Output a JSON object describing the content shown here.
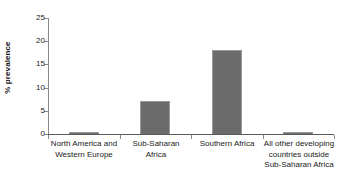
{
  "chart_data": {
    "type": "bar",
    "title": "",
    "subtitle": "",
    "xlabel": "",
    "ylabel": "% prevalence",
    "ylim": [
      0,
      25
    ],
    "yticks": [
      0,
      5,
      10,
      15,
      20,
      25
    ],
    "ytick_labels": [
      "0",
      "5",
      "10",
      "15",
      "20",
      "25"
    ],
    "grid": false,
    "legend": false,
    "legend_position": "none",
    "bar_color": "#6b6b6b",
    "bar_border_color": "#9a9a9a",
    "axis_color": "#8a8a8a",
    "categories": [
      "North America and Western Europe",
      "Sub-Saharan Africa",
      "Southern Africa",
      "All other developing countries outside Sub-Saharan Africa"
    ],
    "category_label_lines": [
      [
        "North America and",
        "Western Europe"
      ],
      [
        "Sub-Saharan",
        "Africa"
      ],
      [
        "Southern Africa"
      ],
      [
        "All other developing",
        "countries outside",
        "Sub-Saharan Africa"
      ]
    ],
    "values": [
      0.4,
      7.2,
      18.0,
      0.4
    ],
    "series": [
      {
        "name": "% prevalence",
        "values": [
          0.4,
          7.2,
          18.0,
          0.4
        ]
      }
    ]
  }
}
